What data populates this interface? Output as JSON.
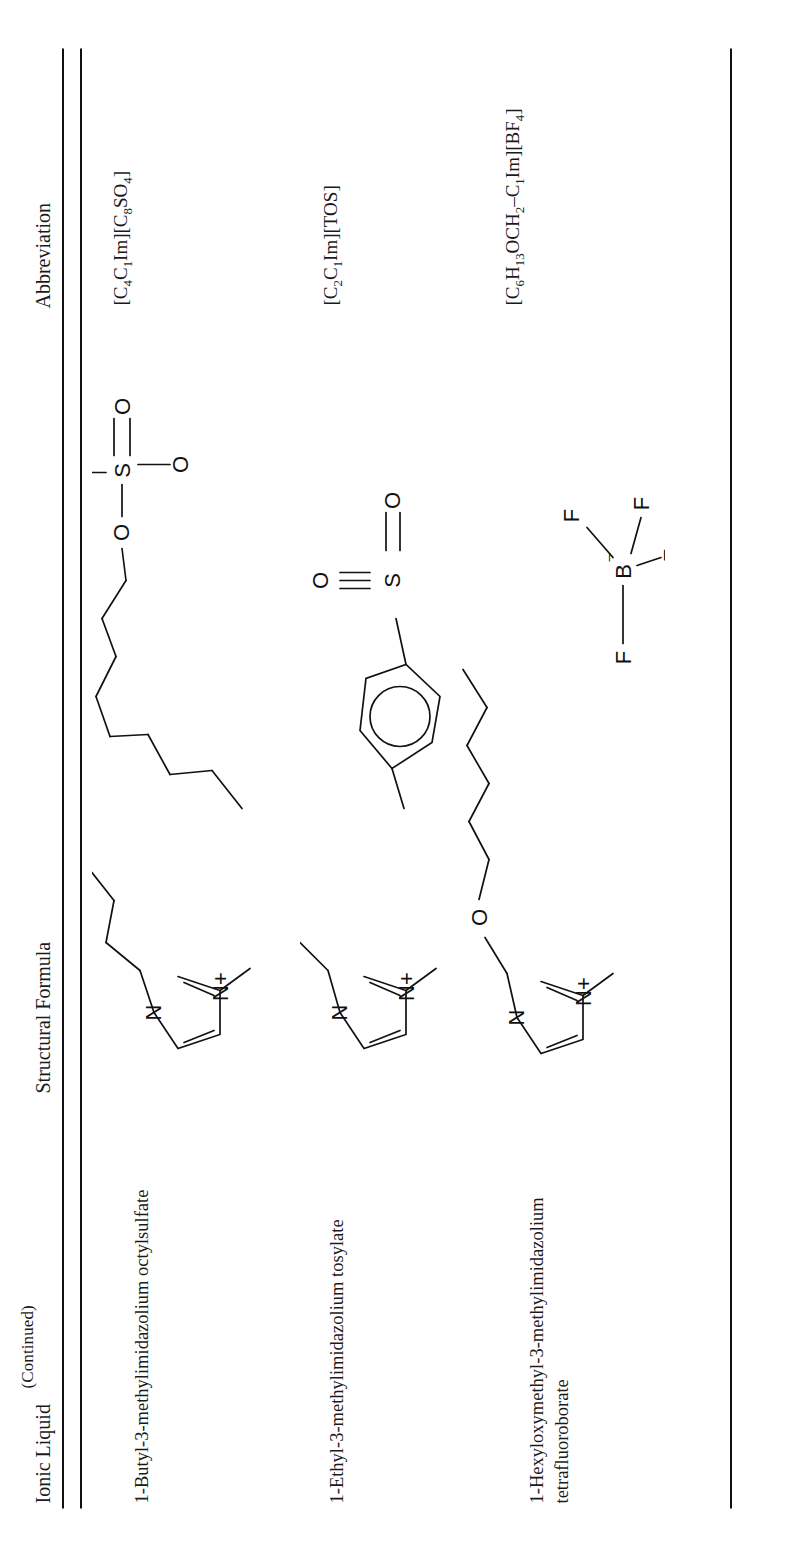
{
  "page": {
    "continued_label": "(Continued)"
  },
  "table": {
    "columns": [
      {
        "key": "ionic_liquid",
        "label": "Ionic Liquid"
      },
      {
        "key": "structural_formula",
        "label": "Structural Formula"
      },
      {
        "key": "abbreviation",
        "label": "Abbreviation"
      }
    ],
    "rows": [
      {
        "ionic_liquid": "1-Butyl-3-methylimidazolium octylsulfate",
        "abbreviation": "[C4C1Im][C8SO4]",
        "abbreviation_parts": [
          {
            "t": "[C"
          },
          {
            "t": "4",
            "sub": true
          },
          {
            "t": "C"
          },
          {
            "t": "1",
            "sub": true
          },
          {
            "t": "Im][C"
          },
          {
            "t": "8",
            "sub": true
          },
          {
            "t": "SO"
          },
          {
            "t": "4",
            "sub": true
          },
          {
            "t": "]"
          }
        ],
        "structure": {
          "name": "butyl-methylimidazolium-octylsulfate",
          "cation": "1-butyl-3-methylimidazolium ring",
          "anion": "octylsulfate",
          "atom_labels": [
            "N",
            "N+",
            "O",
            "O",
            "S",
            "O",
            "O"
          ]
        }
      },
      {
        "ionic_liquid": "1-Ethyl-3-methylimidazolium tosylate",
        "abbreviation": "[C2C1Im][TOS]",
        "abbreviation_parts": [
          {
            "t": "[C"
          },
          {
            "t": "2",
            "sub": true
          },
          {
            "t": "C"
          },
          {
            "t": "1",
            "sub": true
          },
          {
            "t": "Im][TOS]"
          }
        ],
        "structure": {
          "name": "ethyl-methylimidazolium-tosylate",
          "cation": "1-ethyl-3-methylimidazolium ring",
          "anion": "tosylate (para-toluenesulfonate)",
          "atom_labels": [
            "N",
            "N+",
            "O",
            "S",
            "O",
            "O"
          ]
        }
      },
      {
        "ionic_liquid": "1-Hexyloxymethyl-3-methylimidazolium\ntetrafluoroborate",
        "abbreviation": "[C6H13OCH2–C1Im][BF4]",
        "abbreviation_parts": [
          {
            "t": "[C"
          },
          {
            "t": "6",
            "sub": true
          },
          {
            "t": "H"
          },
          {
            "t": "13",
            "sub": true
          },
          {
            "t": "OCH"
          },
          {
            "t": "2",
            "sub": true
          },
          {
            "t": "–C"
          },
          {
            "t": "1",
            "sub": true
          },
          {
            "t": "Im][BF"
          },
          {
            "t": "4",
            "sub": true
          },
          {
            "t": "]"
          }
        ],
        "structure": {
          "name": "hexyloxymethyl-methylimidazolium-tetrafluoroborate",
          "cation": "1-hexyloxymethyl-3-methylimidazolium ring with ether oxygen",
          "anion": "tetrafluoroborate",
          "atom_labels": [
            "N",
            "N+",
            "O",
            "B–",
            "F",
            "F",
            "F",
            "F"
          ]
        }
      }
    ]
  },
  "colors": {
    "ink": "#1a1a1a",
    "rule": "#111111",
    "background": "#ffffff"
  }
}
